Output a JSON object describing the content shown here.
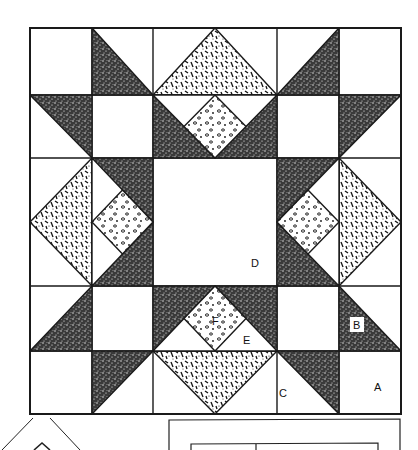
{
  "diagram": {
    "colors": {
      "line": "#1a1a1a",
      "background": "#ffffff",
      "dark_stipple": "#2b2b2b",
      "white": "#ffffff"
    },
    "fabrics": [
      "plain-white",
      "dark-stipple",
      "dash-print",
      "dot-print"
    ],
    "labels": {
      "A": "A",
      "B": "B",
      "C": "C",
      "D": "D",
      "E": "E",
      "F": "F"
    }
  }
}
